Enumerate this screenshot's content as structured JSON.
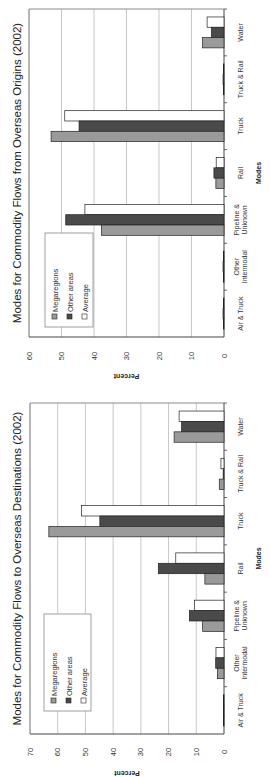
{
  "chart_data": [
    {
      "type": "bar",
      "orientation": "rotated-90-ccw",
      "title": "Modes for Commodity Flows from Overseas Origins (2002)",
      "xlabel": "Modes",
      "ylabel": "Percent",
      "ylim": [
        0,
        60
      ],
      "yticks": [
        0,
        10,
        20,
        30,
        40,
        50,
        60
      ],
      "grid": true,
      "legend_position": "upper-left inside plot",
      "categories": [
        "Air & Truck",
        "Other Intermodal",
        "Pipeline & Unknown",
        "Rail",
        "Truck",
        "Truck & Rail",
        "Water"
      ],
      "category_labels": [
        [
          "Air & Truck"
        ],
        [
          "Other",
          "Intermodal"
        ],
        [
          "Pipeline &",
          "Unknown"
        ],
        [
          "Rail"
        ],
        [
          "Truck"
        ],
        [
          "Truck & Rail"
        ],
        [
          "Water"
        ]
      ],
      "series": [
        {
          "name": "Megaregions",
          "color": "#9a9a9a",
          "values": [
            0.2,
            0.2,
            37.7,
            2.5,
            53.2,
            0.2,
            6.6
          ]
        },
        {
          "name": "Other areas",
          "color": "#4a4a4a",
          "values": [
            0.3,
            0.3,
            48.7,
            3.1,
            44.6,
            0.3,
            3.9
          ]
        },
        {
          "name": "Average",
          "color": "#ffffff",
          "values": [
            0.2,
            0.2,
            42.8,
            2.4,
            49.0,
            0.2,
            5.2
          ]
        }
      ]
    },
    {
      "type": "bar",
      "orientation": "rotated-90-ccw",
      "title": "Modes for Commodity Flows to Overseas Destinations (2002)",
      "xlabel": "Modes",
      "ylabel": "Percent",
      "ylim": [
        0,
        70
      ],
      "yticks": [
        0,
        10,
        20,
        30,
        40,
        50,
        60,
        70
      ],
      "grid": true,
      "legend_position": "upper-left inside plot",
      "categories": [
        "Air & Truck",
        "Other Intermodal",
        "Pipeline & Unknown",
        "Rail",
        "Truck",
        "Truck & Rail",
        "Water"
      ],
      "category_labels": [
        [
          "Air & Truck"
        ],
        [
          "Other",
          "Intermodal"
        ],
        [
          "Pipeline &",
          "Unknown"
        ],
        [
          "Rail"
        ],
        [
          "Truck"
        ],
        [
          "Truck & Rail"
        ],
        [
          "Water"
        ]
      ],
      "series": [
        {
          "name": "Megaregions",
          "color": "#9a9a9a",
          "values": [
            0.2,
            2.4,
            7.7,
            6.9,
            63.2,
            1.7,
            18.0
          ]
        },
        {
          "name": "Other areas",
          "color": "#4a4a4a",
          "values": [
            0.2,
            3.0,
            12.5,
            23.7,
            44.8,
            0.3,
            15.3
          ]
        },
        {
          "name": "Average",
          "color": "#ffffff",
          "values": [
            0.2,
            2.9,
            10.7,
            17.4,
            51.4,
            1.1,
            16.2
          ]
        }
      ]
    }
  ],
  "layout": {
    "panels": [
      {
        "plot": {
          "x0": 29,
          "x1": 224,
          "y0": 9,
          "y1": 337
        },
        "legend": {
          "x": 45,
          "y": 233,
          "w": 48,
          "h": 94
        },
        "title_x": 17,
        "tick_y": 356,
        "ylabel_y": 374,
        "cat_x": 238,
        "modes_x": 258
      },
      {
        "plot": {
          "x0": 30,
          "x1": 224,
          "y0": 403,
          "y1": 734
        },
        "legend": {
          "x": 44,
          "y": 614,
          "w": 47,
          "h": 97
        },
        "title_x": 17,
        "tick_y": 752,
        "ylabel_y": 771,
        "cat_x": 238,
        "modes_x": 258
      }
    ],
    "gridline_color": "#c8c8c8",
    "frame_color": "#8a8a8a",
    "bar_stroke": "#222222"
  }
}
